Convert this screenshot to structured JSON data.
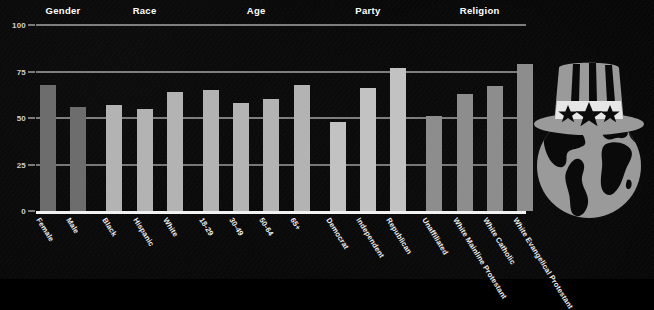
{
  "chart_data": {
    "type": "bar",
    "title": "",
    "xlabel": "",
    "ylabel": "",
    "ylim": [
      0,
      100
    ],
    "yticks": [
      "0",
      "25",
      "50",
      "75",
      "100"
    ],
    "grid": true,
    "legend": "none",
    "groups": [
      {
        "label": "Gender",
        "categories": [
          "Female",
          "Male"
        ],
        "values": [
          68,
          56
        ]
      },
      {
        "label": "Race",
        "categories": [
          "Black",
          "Hispanic",
          "White"
        ],
        "values": [
          57,
          55,
          64
        ]
      },
      {
        "label": "Age",
        "categories": [
          "18-29",
          "30-49",
          "50-64",
          "65+"
        ],
        "values": [
          65,
          58,
          60,
          68
        ]
      },
      {
        "label": "Party",
        "categories": [
          "Democrat",
          "Independent",
          "Republican"
        ],
        "values": [
          48,
          66,
          77
        ]
      },
      {
        "label": "Religion",
        "categories": [
          "Unaffiliated",
          "White Mainline Protestant",
          "White Catholic",
          "White Evangelical Protestant"
        ],
        "values": [
          51,
          63,
          67,
          79
        ]
      }
    ],
    "categories": [
      "Female",
      "Male",
      "Black",
      "Hispanic",
      "White",
      "18-29",
      "30-49",
      "50-64",
      "65+",
      "Democrat",
      "Independent",
      "Republican",
      "Unaffiliated",
      "White Mainline Protestant",
      "White Catholic",
      "White Evangelical Protestant"
    ],
    "values": [
      68,
      56,
      57,
      55,
      64,
      65,
      58,
      60,
      68,
      48,
      66,
      77,
      51,
      63,
      67,
      79
    ]
  },
  "colors": {
    "background": "#070707",
    "axis": "#efefef",
    "tick_text": "#cfcfcf",
    "label_text": "#ededed",
    "bar_dim": "#6d6d6d",
    "bar_mid": "#8d8d8d",
    "bar_light": "#c2c2c2",
    "bar_default": "#b3b3b3",
    "emblem": "#9a9a9a"
  },
  "emblem": {
    "name": "uncle-sam-hat-globe",
    "description": "Uncle Sam top hat with three stars resting on a globe"
  }
}
